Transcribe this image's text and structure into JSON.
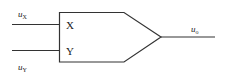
{
  "diagram": {
    "type": "multiplier-block",
    "inputs": [
      {
        "name": "u",
        "subscript": "X",
        "port_label": "X"
      },
      {
        "name": "u",
        "subscript": "Y",
        "port_label": "Y"
      }
    ],
    "output": {
      "name": "u",
      "subscript": "o"
    },
    "colors": {
      "stroke": "#333333",
      "text": "#222222",
      "background": "#ffffff"
    }
  }
}
